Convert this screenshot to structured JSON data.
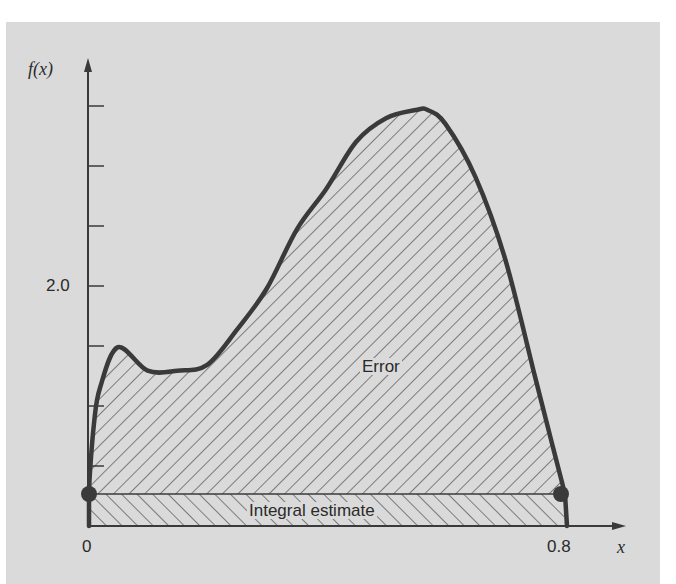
{
  "chart_data": {
    "type": "area",
    "title": "",
    "xlabel": "x",
    "ylabel": "f(x)",
    "x_ticks": [
      {
        "value": 0,
        "label": "0"
      },
      {
        "value": 0.8,
        "label": "0.8"
      }
    ],
    "y_ticks": [
      {
        "value": 0.5,
        "label": ""
      },
      {
        "value": 1.0,
        "label": ""
      },
      {
        "value": 1.5,
        "label": ""
      },
      {
        "value": 2.0,
        "label": "2.0"
      },
      {
        "value": 2.5,
        "label": ""
      },
      {
        "value": 3.0,
        "label": ""
      },
      {
        "value": 3.5,
        "label": ""
      }
    ],
    "xlim": [
      0,
      0.8
    ],
    "ylim": [
      0,
      3.6
    ],
    "grid": false,
    "curve": {
      "name": "f(x)",
      "x": [
        0,
        0.01,
        0.02,
        0.05,
        0.1,
        0.15,
        0.2,
        0.25,
        0.3,
        0.35,
        0.4,
        0.45,
        0.5,
        0.55,
        0.57,
        0.6,
        0.65,
        0.7,
        0.75,
        0.78,
        0.8
      ],
      "y": [
        0.2,
        0.8,
        1.1,
        1.45,
        1.25,
        1.25,
        1.3,
        1.6,
        1.95,
        2.45,
        2.8,
        3.2,
        3.4,
        3.47,
        3.47,
        3.35,
        2.9,
        2.2,
        1.2,
        0.6,
        0.2
      ]
    },
    "regions": [
      {
        "name": "Error",
        "hatch": "forward-diagonal",
        "description": "area between f(x) and integral estimate"
      },
      {
        "name": "Integral estimate",
        "hatch": "back-diagonal",
        "height": 0.2,
        "from": 0,
        "to": 0.8
      }
    ],
    "endpoints": [
      {
        "x": 0,
        "y": 0.2
      },
      {
        "x": 0.8,
        "y": 0.2
      }
    ]
  },
  "labels": {
    "y_axis": "f(x)",
    "x_axis": "x",
    "y_tick_2": "2.0",
    "x_tick_0": "0",
    "x_tick_08": "0.8",
    "error": "Error",
    "integral_estimate": "Integral estimate"
  },
  "colors": {
    "background": "#dadada",
    "ink": "#3a3a3a"
  }
}
